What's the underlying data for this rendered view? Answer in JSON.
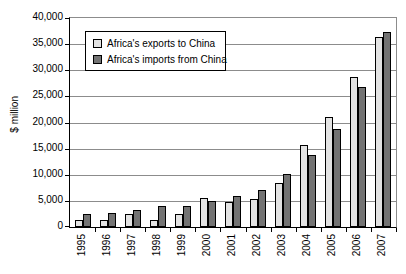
{
  "chart_data": {
    "type": "bar",
    "title": "",
    "ylabel": "$ million",
    "units": "$ million",
    "categories": [
      "1995",
      "1996",
      "1997",
      "1998",
      "1999",
      "2000",
      "2001",
      "2002",
      "2003",
      "2004",
      "2005",
      "2006",
      "2007"
    ],
    "series": [
      {
        "name": "Africa's exports to China",
        "color": "#e3e3e3",
        "values": [
          1400,
          1400,
          2400,
          1400,
          2400,
          5500,
          4800,
          5400,
          8400,
          15600,
          21100,
          28800,
          36300
        ]
      },
      {
        "name": "Africa's imports from China",
        "color": "#737373",
        "values": [
          2500,
          2600,
          3200,
          4000,
          4100,
          5000,
          6000,
          7000,
          10200,
          13800,
          18700,
          26700,
          37300
        ]
      }
    ],
    "ylim": [
      0,
      40000
    ],
    "yticks": [
      {
        "value": 0,
        "label": "0"
      },
      {
        "value": 5000,
        "label": "5,000"
      },
      {
        "value": 10000,
        "label": "10,000"
      },
      {
        "value": 15000,
        "label": "15,000"
      },
      {
        "value": 20000,
        "label": "20,000"
      },
      {
        "value": 25000,
        "label": "25,000"
      },
      {
        "value": 30000,
        "label": "30,000"
      },
      {
        "value": 35000,
        "label": "35,000"
      },
      {
        "value": 40000,
        "label": "40,000"
      }
    ],
    "grid": true,
    "legend_position": "inside-top-left",
    "colors": {
      "axis": "#000000",
      "gridline": "#8c8c8c",
      "background": "#ffffff",
      "bar_border": "#000000"
    }
  }
}
